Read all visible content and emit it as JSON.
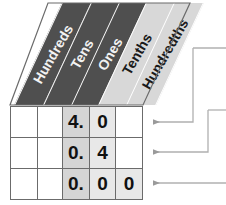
{
  "diagram": {
    "colors": {
      "header_dark_bg": "#4f4f4f",
      "header_dark_text": "#f2f2f2",
      "header_light_bg": "#d8d8d8",
      "header_light_text": "#1a1a1a",
      "grid_line": "#6b6b6b",
      "ones_column_bg": "#d5d5d5",
      "tenths_column_bg": "#e8e8e8",
      "arrow": "#9a9a9a"
    }
  },
  "headers": [
    {
      "key": "hundreds",
      "label": "Hundreds",
      "style": "dark"
    },
    {
      "key": "tens",
      "label": "Tens",
      "style": "dark"
    },
    {
      "key": "ones",
      "label": "Ones",
      "style": "dark"
    },
    {
      "key": "tenths",
      "label": "Tenths",
      "style": "light"
    },
    {
      "key": "hundredths",
      "label": "Hundredths",
      "style": "light"
    }
  ],
  "rows": [
    {
      "id": "row-1",
      "value": "4.0",
      "cells": {
        "hundreds": "",
        "tens": "",
        "ones": "4.",
        "tenths": "0",
        "hundredths": ""
      }
    },
    {
      "id": "row-2",
      "value": "0.4",
      "cells": {
        "hundreds": "",
        "tens": "",
        "ones": "0.",
        "tenths": "4",
        "hundredths": ""
      }
    },
    {
      "id": "row-3",
      "value": "0.00",
      "cells": {
        "hundreds": "",
        "tens": "",
        "ones": "0.",
        "tenths": "0",
        "hundredths": "0"
      }
    }
  ],
  "connectors": [
    {
      "id": "connector-row-1",
      "target_row": "row-1",
      "shape": "right-then-up"
    },
    {
      "id": "connector-row-2",
      "target_row": "row-2",
      "shape": "right-then-up"
    },
    {
      "id": "connector-row-3",
      "target_row": "row-3",
      "shape": "straight-right"
    }
  ]
}
